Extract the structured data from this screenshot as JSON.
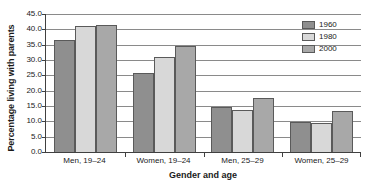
{
  "chart_data": {
    "type": "bar",
    "title": "",
    "xlabel": "Gender and age",
    "ylabel": "Percentage living with parents",
    "categories": [
      "Men, 19–24",
      "Women, 19–24",
      "Men, 25–29",
      "Women, 25–29"
    ],
    "series": [
      {
        "name": "1960",
        "color": "#8f8f8f",
        "values": [
          36.5,
          25.8,
          14.7,
          9.9
        ]
      },
      {
        "name": "1980",
        "color": "#d8d8d8",
        "values": [
          41.0,
          31.0,
          13.8,
          9.3
        ]
      },
      {
        "name": "2000",
        "color": "#a8a8a8",
        "values": [
          41.5,
          34.5,
          17.6,
          13.5
        ]
      }
    ],
    "ylim": [
      0,
      45
    ],
    "ytick_step": 5,
    "ytick_labels": [
      "0.0",
      "5.0",
      "10.0",
      "15.0",
      "20.0",
      "25.0",
      "30.0",
      "35.0",
      "40.0",
      "45.0"
    ],
    "ytick_values": [
      0,
      5,
      10,
      15,
      20,
      25,
      30,
      35,
      40,
      45
    ],
    "grid": true,
    "grid_axis": "y",
    "legend_position": "top-right",
    "legend_entries": [
      "1960",
      "1980",
      "2000"
    ]
  }
}
